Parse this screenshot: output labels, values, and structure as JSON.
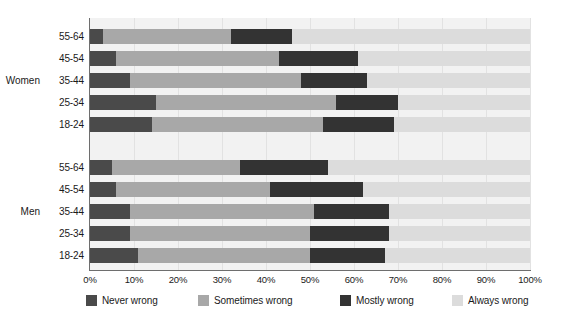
{
  "chart_data": {
    "type": "bar",
    "orientation": "horizontal",
    "stacked": true,
    "stacked_mode": "percent",
    "title": "",
    "subtitle": "",
    "xlabel": "",
    "ylabel": "",
    "xlim": [
      0,
      100
    ],
    "xticks": [
      0,
      10,
      20,
      30,
      40,
      50,
      60,
      70,
      80,
      90,
      100
    ],
    "xtick_labels": [
      "0%",
      "10%",
      "20%",
      "30%",
      "40%",
      "50%",
      "60%",
      "70%",
      "80%",
      "90%",
      "100%"
    ],
    "grid": true,
    "grid_axis": "x",
    "legend_position": "bottom",
    "legend": [
      "Never wrong",
      "Sometimes wrong",
      "Mostly wrong",
      "Always wrong"
    ],
    "colors": {
      "never_wrong": "#4a4a4a",
      "sometimes_wrong": "#a8a8a8",
      "mostly_wrong": "#333333",
      "always_wrong": "#dcdcdc",
      "plot_background": "#f2f2f2",
      "axis": "#6e6e6e",
      "gridline": "#e2e2e2",
      "text": "#1a1a1a"
    },
    "groups": [
      {
        "name": "Women",
        "categories": [
          "55-64",
          "45-54",
          "35-44",
          "25-34",
          "18-24"
        ]
      },
      {
        "name": "Men",
        "categories": [
          "55-64",
          "45-54",
          "35-44",
          "25-34",
          "18-24"
        ]
      }
    ],
    "series": [
      {
        "name": "Never wrong",
        "color": "#4a4a4a",
        "values": [
          3,
          6,
          9,
          15,
          14,
          5,
          6,
          9,
          9,
          11
        ]
      },
      {
        "name": "Sometimes wrong",
        "color": "#a8a8a8",
        "values": [
          29,
          37,
          39,
          41,
          39,
          29,
          35,
          42,
          41,
          39
        ]
      },
      {
        "name": "Mostly wrong",
        "color": "#333333",
        "values": [
          14,
          18,
          15,
          14,
          16,
          20,
          21,
          17,
          18,
          17
        ]
      },
      {
        "name": "Always wrong",
        "color": "#dcdcdc",
        "values": [
          54,
          39,
          37,
          30,
          31,
          46,
          38,
          32,
          32,
          33
        ]
      }
    ],
    "rows": [
      {
        "group": "Women",
        "category": "55-64",
        "never_wrong": 3,
        "sometimes_wrong": 29,
        "mostly_wrong": 14,
        "always_wrong": 54
      },
      {
        "group": "Women",
        "category": "45-54",
        "never_wrong": 6,
        "sometimes_wrong": 37,
        "mostly_wrong": 18,
        "always_wrong": 39
      },
      {
        "group": "Women",
        "category": "35-44",
        "never_wrong": 9,
        "sometimes_wrong": 39,
        "mostly_wrong": 15,
        "always_wrong": 37
      },
      {
        "group": "Women",
        "category": "25-34",
        "never_wrong": 15,
        "sometimes_wrong": 41,
        "mostly_wrong": 14,
        "always_wrong": 30
      },
      {
        "group": "Women",
        "category": "18-24",
        "never_wrong": 14,
        "sometimes_wrong": 39,
        "mostly_wrong": 16,
        "always_wrong": 31
      },
      {
        "group": "Men",
        "category": "55-64",
        "never_wrong": 5,
        "sometimes_wrong": 29,
        "mostly_wrong": 20,
        "always_wrong": 46
      },
      {
        "group": "Men",
        "category": "45-54",
        "never_wrong": 6,
        "sometimes_wrong": 35,
        "mostly_wrong": 21,
        "always_wrong": 38
      },
      {
        "group": "Men",
        "category": "35-44",
        "never_wrong": 9,
        "sometimes_wrong": 42,
        "mostly_wrong": 17,
        "always_wrong": 32
      },
      {
        "group": "Men",
        "category": "25-34",
        "never_wrong": 9,
        "sometimes_wrong": 41,
        "mostly_wrong": 18,
        "always_wrong": 32
      },
      {
        "group": "Men",
        "category": "18-24",
        "never_wrong": 11,
        "sometimes_wrong": 39,
        "mostly_wrong": 17,
        "always_wrong": 33
      }
    ]
  }
}
